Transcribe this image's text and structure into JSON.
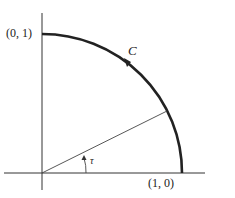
{
  "diagram": {
    "point_top_label": "(0, 1)",
    "point_right_label": "(1, 0)",
    "curve_label": "C",
    "angle_label": "τ",
    "colors": {
      "stroke": "#222222",
      "background": "#ffffff"
    }
  }
}
